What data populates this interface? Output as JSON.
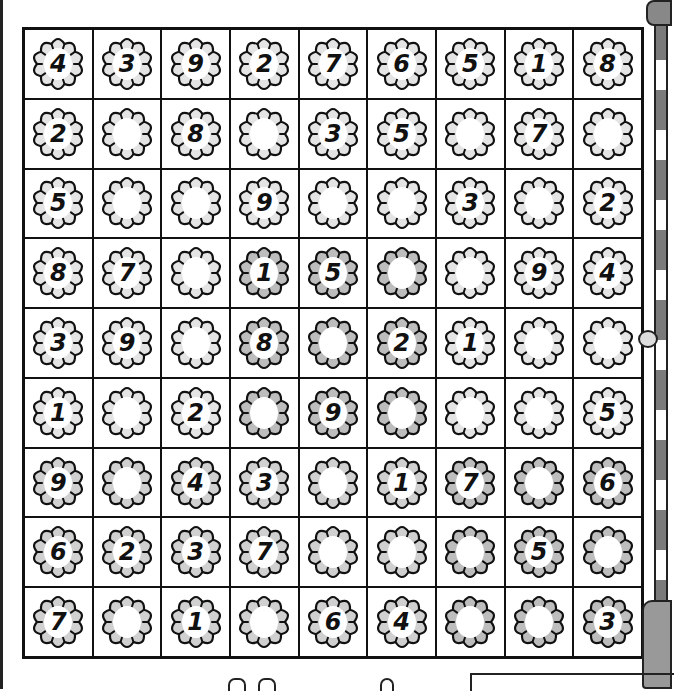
{
  "puzzle": {
    "type": "sudoku",
    "size": 9,
    "colors": {
      "light": "#e4e4e4",
      "medium": "#d0d0d0",
      "dark": "#bdbdbd",
      "outline": "#111111",
      "center": "#ffffff"
    },
    "rows": [
      [
        "4",
        "3",
        "9",
        "2",
        "7",
        "6",
        "5",
        "1",
        "8"
      ],
      [
        "2",
        "",
        "8",
        "",
        "3",
        "5",
        "",
        "7",
        ""
      ],
      [
        "5",
        "",
        "",
        "9",
        "",
        "",
        "3",
        "",
        "2"
      ],
      [
        "8",
        "7",
        "",
        "1",
        "5",
        "",
        "",
        "9",
        "4"
      ],
      [
        "3",
        "9",
        "",
        "8",
        "",
        "2",
        "1",
        "",
        ""
      ],
      [
        "1",
        "",
        "2",
        "",
        "9",
        "",
        "",
        "",
        "5"
      ],
      [
        "9",
        "",
        "4",
        "3",
        "",
        "1",
        "7",
        "",
        "6"
      ],
      [
        "6",
        "2",
        "3",
        "7",
        "",
        "",
        "",
        "5",
        ""
      ],
      [
        "7",
        "",
        "1",
        "",
        "6",
        "4",
        "",
        "",
        "3"
      ]
    ],
    "shades": [
      [
        "light",
        "light",
        "light",
        "light",
        "light",
        "light",
        "light",
        "light",
        "light"
      ],
      [
        "light",
        "light",
        "light",
        "light",
        "light",
        "light",
        "light",
        "light",
        "light"
      ],
      [
        "light",
        "light",
        "light",
        "light",
        "light",
        "light",
        "light",
        "light",
        "light"
      ],
      [
        "light",
        "light",
        "light",
        "dark",
        "dark",
        "dark",
        "light",
        "light",
        "light"
      ],
      [
        "light",
        "light",
        "light",
        "dark",
        "dark",
        "dark",
        "light",
        "light",
        "light"
      ],
      [
        "light",
        "light",
        "light",
        "dark",
        "dark",
        "dark",
        "light",
        "light",
        "light"
      ],
      [
        "medium",
        "medium",
        "medium",
        "medium",
        "medium",
        "medium",
        "dark",
        "dark",
        "dark"
      ],
      [
        "medium",
        "medium",
        "medium",
        "medium",
        "medium",
        "medium",
        "dark",
        "dark",
        "dark"
      ],
      [
        "medium",
        "medium",
        "medium",
        "medium",
        "medium",
        "medium",
        "dark",
        "dark",
        "dark"
      ]
    ]
  }
}
